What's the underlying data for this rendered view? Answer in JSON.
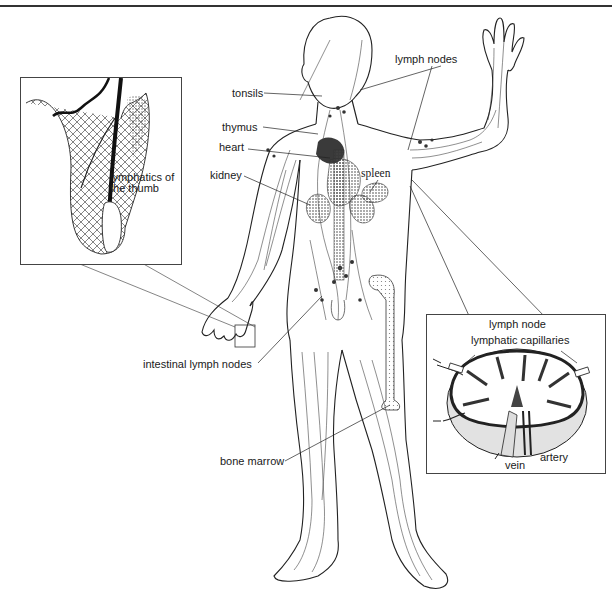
{
  "figure": {
    "labels": {
      "lymph_nodes": "lymph nodes",
      "tonsils": "tonsils",
      "thymus": "thymus",
      "heart": "heart",
      "kidney": "kidney",
      "spleen": "spleen",
      "intestinal_lymph_nodes": "intestinal lymph nodes",
      "bone_marrow": "bone marrow"
    },
    "inset_thumb": {
      "caption_line1": "lymphatics of",
      "caption_line2": "the thumb"
    },
    "inset_node": {
      "title": "lymph node",
      "capillaries": "lymphatic capillaries",
      "vein": "vein",
      "artery": "artery"
    },
    "colors": {
      "ink": "#1a1a1a",
      "organ_fill": "#555555",
      "shade": "#d9d9d9"
    }
  }
}
